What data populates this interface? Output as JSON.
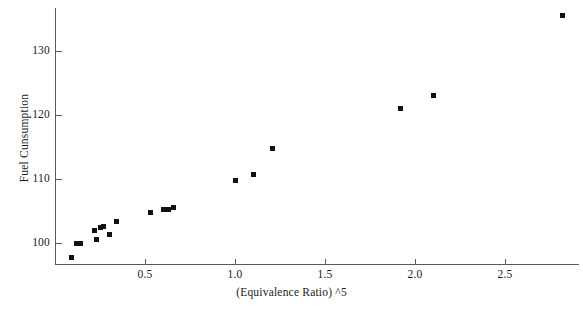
{
  "chart_data": {
    "type": "scatter",
    "title": "",
    "xlabel": "(Equivalence Ratio) ^5",
    "ylabel": "Fuel Cunsumption",
    "xlim": [
      0.0,
      2.91
    ],
    "ylim": [
      97.0,
      136.5
    ],
    "grid": false,
    "legend": null,
    "marker": "square",
    "marker_color": "#111111",
    "xticks": [
      "0.5",
      "1.0",
      "1.5",
      "2.0",
      "2.5"
    ],
    "xtick_values": [
      0.5,
      1.0,
      1.5,
      2.0,
      2.5
    ],
    "yticks": [
      "100",
      "110",
      "120",
      "130"
    ],
    "ytick_values": [
      100,
      110,
      120,
      130
    ],
    "points": [
      {
        "x": 0.09,
        "y": 97.8
      },
      {
        "x": 0.12,
        "y": 99.9
      },
      {
        "x": 0.14,
        "y": 99.9
      },
      {
        "x": 0.22,
        "y": 101.9
      },
      {
        "x": 0.23,
        "y": 100.6
      },
      {
        "x": 0.25,
        "y": 102.5
      },
      {
        "x": 0.27,
        "y": 102.6
      },
      {
        "x": 0.3,
        "y": 101.4
      },
      {
        "x": 0.34,
        "y": 103.4
      },
      {
        "x": 0.53,
        "y": 104.8
      },
      {
        "x": 0.6,
        "y": 105.2
      },
      {
        "x": 0.63,
        "y": 105.2
      },
      {
        "x": 0.66,
        "y": 105.6
      },
      {
        "x": 1.0,
        "y": 109.8
      },
      {
        "x": 1.1,
        "y": 110.7
      },
      {
        "x": 1.21,
        "y": 114.7
      },
      {
        "x": 1.92,
        "y": 121.0
      },
      {
        "x": 2.1,
        "y": 123.0
      },
      {
        "x": 2.82,
        "y": 135.6
      }
    ]
  },
  "axes": {
    "x_title": "(Equivalence Ratio) ^5",
    "y_title": "Fuel Cunsumption"
  },
  "colors": {
    "marker": "#111111",
    "axis": "#5a5a5a",
    "text": "#1a1a1a",
    "background": "#ffffff"
  }
}
